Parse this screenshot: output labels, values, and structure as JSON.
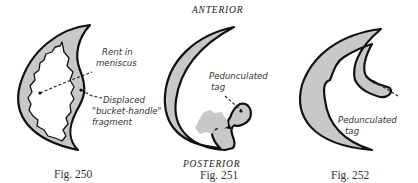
{
  "headings": {
    "top": "ANTERIOR",
    "bottom": "POSTERIOR"
  },
  "figures": [
    {
      "caption": "Fig. 250",
      "labels": {
        "rent_line1": "Rent in",
        "rent_line2": "meniscus",
        "displaced_line1": "Displaced",
        "displaced_line2": "\"bucket-handle\"",
        "displaced_line3": "fragment"
      }
    },
    {
      "caption": "Fig. 251",
      "labels": {
        "tag_line1": "Pedunculated",
        "tag_line2": "tag"
      }
    },
    {
      "caption": "Fig. 252",
      "labels": {
        "tag_line1": "Pedunculated",
        "tag_line2": "tag"
      }
    }
  ],
  "colors": {
    "meniscus_fill": "#c8c8c8",
    "outline": "#111111",
    "background": "#ffffff"
  }
}
